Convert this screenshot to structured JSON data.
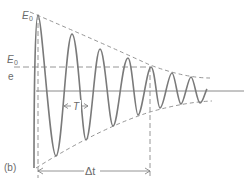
{
  "diagram": {
    "panel_label": "(b)",
    "labels": {
      "initial_amplitude": "E",
      "initial_amplitude_sub": "0",
      "decayed_amplitude_num": "E",
      "decayed_amplitude_num_sub": "0",
      "decayed_amplitude_den": "e",
      "period": "T",
      "time_interval": "Δt"
    },
    "colors": {
      "wave": "#7a7a7a",
      "envelope": "#8a8a8a",
      "axis": "#888888",
      "text": "#6a6a6a"
    }
  }
}
